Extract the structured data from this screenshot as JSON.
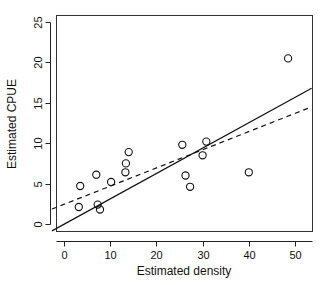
{
  "chart_data": {
    "type": "scatter",
    "title": "",
    "xlabel": "Estimated density",
    "ylabel": "Estimated CPUE",
    "xlim": [
      -2.6,
      53.6
    ],
    "ylim": [
      -1.2,
      26.6
    ],
    "xticks": [
      0,
      10,
      20,
      30,
      40,
      50
    ],
    "yticks": [
      0,
      5,
      10,
      15,
      20,
      25
    ],
    "xticklabels": [
      "0",
      "10",
      "20",
      "30",
      "40",
      "50"
    ],
    "yticklabels": [
      "0",
      "5",
      "10",
      "15",
      "20",
      "25"
    ],
    "grid": false,
    "legend": false,
    "legend_position": "none",
    "point_marker": "open-circle",
    "point_color": "#111111",
    "x": [
      3.2,
      3.5,
      7.0,
      7.3,
      7.8,
      10.2,
      13.3,
      13.4,
      14.0,
      25.6,
      26.3,
      27.3,
      30.0,
      30.8,
      40.0,
      48.5
    ],
    "y": [
      2.1,
      4.7,
      6.1,
      2.4,
      1.8,
      5.2,
      6.4,
      7.5,
      8.9,
      9.8,
      6.0,
      4.6,
      8.5,
      10.2,
      6.4,
      20.5
    ],
    "points": [
      {
        "x": 3.2,
        "y": 2.1
      },
      {
        "x": 3.5,
        "y": 4.7
      },
      {
        "x": 7.0,
        "y": 6.1
      },
      {
        "x": 7.3,
        "y": 2.4
      },
      {
        "x": 7.8,
        "y": 1.8
      },
      {
        "x": 10.2,
        "y": 5.2
      },
      {
        "x": 13.3,
        "y": 6.4
      },
      {
        "x": 13.4,
        "y": 7.5
      },
      {
        "x": 14.0,
        "y": 8.9
      },
      {
        "x": 25.6,
        "y": 9.8
      },
      {
        "x": 26.3,
        "y": 6.0
      },
      {
        "x": 27.3,
        "y": 4.6
      },
      {
        "x": 30.0,
        "y": 8.5
      },
      {
        "x": 30.8,
        "y": 10.2
      },
      {
        "x": 40.0,
        "y": 6.4
      },
      {
        "x": 48.5,
        "y": 20.5
      }
    ],
    "series": [
      {
        "name": "observations",
        "type": "scatter",
        "marker": "open-circle",
        "values": [
          2.1,
          4.7,
          6.1,
          2.4,
          1.8,
          5.2,
          6.4,
          7.5,
          8.9,
          9.8,
          6.0,
          4.6,
          8.5,
          10.2,
          6.4,
          20.5
        ]
      },
      {
        "name": "regression-through-origin",
        "type": "line",
        "style": "solid",
        "x_endpoints": [
          -2.6,
          53.6
        ],
        "y_endpoints": [
          -0.85,
          16.8
        ]
      },
      {
        "name": "ordinary-least-squares",
        "type": "line",
        "style": "dashed",
        "x_endpoints": [
          -2.6,
          53.6
        ],
        "y_endpoints": [
          1.85,
          14.5
        ]
      }
    ]
  },
  "axes": {
    "x_title": "Estimated density",
    "y_title": "Estimated CPUE"
  }
}
